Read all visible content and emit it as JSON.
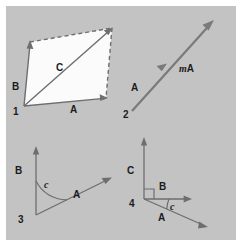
{
  "figure": {
    "background_color": "#ffffff",
    "canvas_color": "#c3c3c3",
    "stroke_color": "#6e6e6e",
    "fill_color": "#fbfbfb",
    "text_color": "#1b1b1b"
  },
  "panels": [
    {
      "index": "1",
      "caption": "",
      "vectors": [
        {
          "name": "A",
          "label": "A"
        },
        {
          "name": "B",
          "label": "B"
        },
        {
          "name": "C",
          "label": "C"
        }
      ],
      "shape": "parallelogram"
    },
    {
      "index": "2",
      "caption": "",
      "vectors": [
        {
          "name": "A",
          "label": "A"
        },
        {
          "name": "mA",
          "scalar": "m",
          "vector": "A"
        }
      ],
      "shape": "collinear-scaled-vector"
    },
    {
      "index": "3",
      "caption": "",
      "vectors": [
        {
          "name": "A",
          "label": "A"
        },
        {
          "name": "B",
          "label": "B"
        }
      ],
      "angles": [
        {
          "name": "c",
          "label": "c"
        }
      ],
      "shape": "two-vectors-with-angle"
    },
    {
      "index": "4",
      "caption": "",
      "vectors": [
        {
          "name": "A",
          "label": "A"
        },
        {
          "name": "B",
          "label": "B"
        },
        {
          "name": "C",
          "label": "C"
        }
      ],
      "angles": [
        {
          "name": "c",
          "label": "c"
        }
      ],
      "shape": "three-vectors-right-angle"
    }
  ]
}
